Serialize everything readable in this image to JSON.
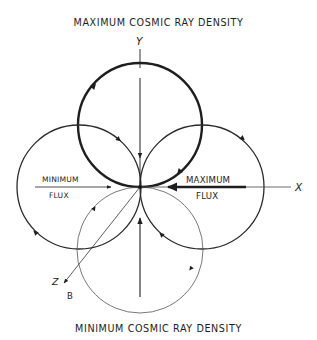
{
  "figure": {
    "title_top": "MAXIMUM  COSMIC  RAY  DENSITY",
    "title_bottom": "MINIMUM  COSMIC  RAY  DENSITY",
    "axes": {
      "x_label": "X",
      "y_label": "Y",
      "z_label": "Z",
      "field_label": "B"
    },
    "flux_labels": {
      "minimum_line1": "MINIMUM",
      "minimum_line2": "FLUX",
      "maximum_line1": "MAXIMUM",
      "maximum_line2": "FLUX"
    },
    "orbits": [
      {
        "name": "top",
        "cx": 140,
        "cy": 125,
        "r": 62,
        "weight": "bold",
        "direction": "clockwise"
      },
      {
        "name": "left",
        "cx": 79,
        "cy": 187,
        "r": 62,
        "weight": "medium",
        "direction": "clockwise"
      },
      {
        "name": "right",
        "cx": 202,
        "cy": 187,
        "r": 62,
        "weight": "medium",
        "direction": "clockwise"
      },
      {
        "name": "bottom",
        "cx": 140,
        "cy": 250,
        "r": 63,
        "weight": "thin",
        "direction": "clockwise"
      }
    ],
    "colors": {
      "ink": "#1e1e1e",
      "background": "#ffffff"
    }
  }
}
